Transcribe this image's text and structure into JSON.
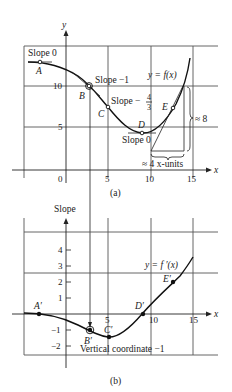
{
  "figure_a": {
    "caption": "(a)",
    "y_axis_label": "y",
    "x_axis_label": "x",
    "curve_label": "y = f(x)",
    "x_ticks": [
      "0",
      "5",
      "10",
      "15"
    ],
    "y_ticks": [
      "5",
      "10"
    ],
    "points": [
      {
        "name": "A",
        "x": -3,
        "y": 12.8,
        "annotation": "Slope 0"
      },
      {
        "name": "B",
        "x": 2.7,
        "y": 10,
        "annotation": "Slope −1"
      },
      {
        "name": "C",
        "x": 5,
        "y": 7.6,
        "annotation": "Slope −4/3"
      },
      {
        "name": "D",
        "x": 9,
        "y": 4.4,
        "annotation": "Slope 0"
      },
      {
        "name": "E",
        "x": 12.6,
        "y": 7.5,
        "annotation": ""
      }
    ],
    "slope_labels": {
      "a": "Slope 0",
      "b": "Slope −1",
      "c_prefix": "Slope −",
      "c_num": "4",
      "c_den": "3",
      "d": "Slope 0"
    },
    "rise_label": "≈ 8",
    "run_label": "≈ 4 x-units"
  },
  "figure_b": {
    "caption": "(b)",
    "y_axis_label": "Slope",
    "x_axis_label": "x",
    "curve_label": "y = f ′(x)",
    "x_ticks": [
      "5",
      "10",
      "15"
    ],
    "y_ticks": [
      "4",
      "3",
      "2",
      "1",
      "−1",
      "−2"
    ],
    "points": [
      {
        "name": "A′",
        "x": -3,
        "y": 0
      },
      {
        "name": "B′",
        "x": 2.7,
        "y": -1
      },
      {
        "name": "C′",
        "x": 5,
        "y": -1.33
      },
      {
        "name": "D′",
        "x": 9,
        "y": 0
      },
      {
        "name": "E′",
        "x": 12.6,
        "y": 2
      }
    ],
    "note": "Vertical coordinate −1"
  }
}
